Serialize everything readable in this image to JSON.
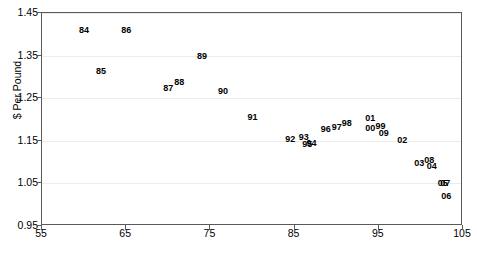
{
  "chart_data": {
    "type": "scatter",
    "title": "",
    "subtitle": "",
    "xlabel": "",
    "ylabel": "$ Per Pound",
    "xlim": [
      55,
      105
    ],
    "ylim": [
      0.95,
      1.45
    ],
    "xticks": [
      55,
      65,
      75,
      85,
      95,
      105
    ],
    "yticks": [
      "0.95",
      "1.05",
      "1.15",
      "1.25",
      "1.35",
      "1.45"
    ],
    "ytick_values": [
      0.95,
      1.05,
      1.15,
      1.25,
      1.35,
      1.45
    ],
    "grid": "horizontal",
    "legend": "none",
    "marker_style": "text-label",
    "annotations": [],
    "points": [
      {
        "label": "84",
        "x": 60.0,
        "y": 1.41
      },
      {
        "label": "85",
        "x": 62.0,
        "y": 1.315
      },
      {
        "label": "86",
        "x": 65.0,
        "y": 1.41
      },
      {
        "label": "87",
        "x": 70.0,
        "y": 1.273
      },
      {
        "label": "88",
        "x": 71.3,
        "y": 1.288
      },
      {
        "label": "89",
        "x": 74.0,
        "y": 1.35
      },
      {
        "label": "90",
        "x": 76.5,
        "y": 1.268
      },
      {
        "label": "91",
        "x": 80.0,
        "y": 1.205
      },
      {
        "label": "92",
        "x": 84.5,
        "y": 1.155
      },
      {
        "label": "93",
        "x": 86.1,
        "y": 1.158
      },
      {
        "label": "94",
        "x": 87.0,
        "y": 1.145
      },
      {
        "label": "95",
        "x": 86.5,
        "y": 1.143
      },
      {
        "label": "96",
        "x": 88.7,
        "y": 1.178
      },
      {
        "label": "97",
        "x": 90.0,
        "y": 1.182
      },
      {
        "label": "98",
        "x": 91.2,
        "y": 1.192
      },
      {
        "label": "99",
        "x": 95.2,
        "y": 1.185
      },
      {
        "label": "00",
        "x": 94.0,
        "y": 1.18
      },
      {
        "label": "01",
        "x": 94.0,
        "y": 1.203
      },
      {
        "label": "02",
        "x": 97.8,
        "y": 1.152
      },
      {
        "label": "03",
        "x": 99.8,
        "y": 1.098
      },
      {
        "label": "04",
        "x": 101.3,
        "y": 1.092
      },
      {
        "label": "05",
        "x": 102.6,
        "y": 1.05
      },
      {
        "label": "06",
        "x": 103.0,
        "y": 1.02
      },
      {
        "label": "07",
        "x": 102.9,
        "y": 1.05
      },
      {
        "label": "08",
        "x": 101.0,
        "y": 1.105
      },
      {
        "label": "09",
        "x": 95.6,
        "y": 1.168
      }
    ]
  },
  "colors": {
    "axis": "#5a5a5a",
    "grid": "#ececec",
    "label_text": "#000000",
    "background": "#ffffff"
  }
}
